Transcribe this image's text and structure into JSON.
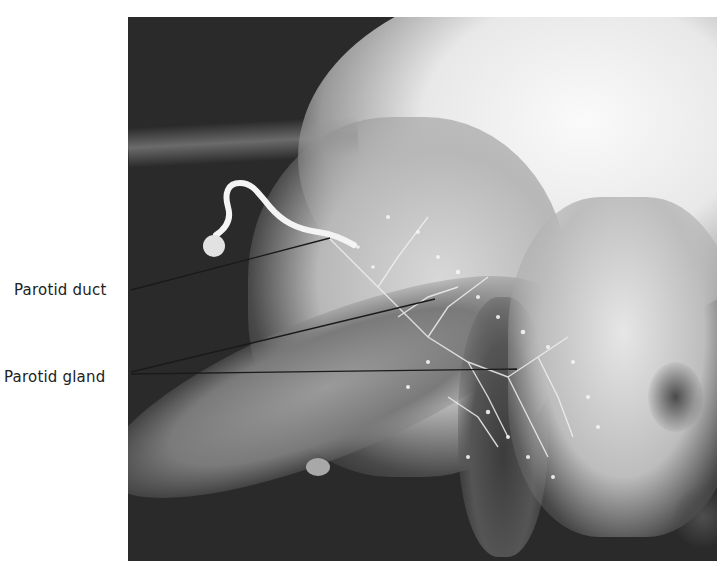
{
  "figure": {
    "type": "sialogram radiograph",
    "labels": [
      {
        "text": "Parotid duct",
        "x": 14,
        "y": 281
      },
      {
        "text": "Parotid gland",
        "x": 4,
        "y": 368
      }
    ],
    "leader_lines": [
      {
        "for": "Parotid duct",
        "x1": 131,
        "y1": 290,
        "x2": 330,
        "y2": 238
      },
      {
        "for": "Parotid gland",
        "x1": 131,
        "y1": 372,
        "x2": 435,
        "y2": 299
      },
      {
        "for": "Parotid gland",
        "x1": 131,
        "y1": 374,
        "x2": 517,
        "y2": 369
      }
    ],
    "colors": {
      "background": "#ffffff",
      "xray_dark": "#2a2a2a",
      "xray_bright": "#f2f2f2",
      "leader_line": "#1a1a1a",
      "label_text": "#222222"
    }
  }
}
